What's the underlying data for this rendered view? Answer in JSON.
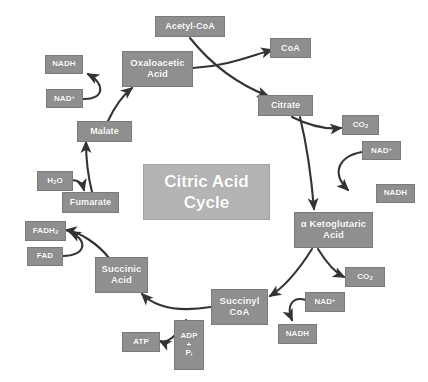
{
  "diagram": {
    "title": "Citric Acid\nCycle",
    "background_color": "#ffffff",
    "node_color": "#8f8f8f",
    "center_color": "#b4b4b4",
    "text_color": "#ffffff",
    "arrow_color": "#333333"
  },
  "nodes": [
    {
      "id": "acetyl-coa",
      "label": "Acetyl-CoA",
      "x": 155,
      "y": 16,
      "w": 70,
      "h": 21,
      "size": "n-mid"
    },
    {
      "id": "coa",
      "label": "CoA",
      "x": 270,
      "y": 38,
      "w": 41,
      "h": 20,
      "size": "n-mid"
    },
    {
      "id": "oxaloacetic",
      "label": "Oxaloacetic\nAcid",
      "x": 122,
      "y": 51,
      "w": 71,
      "h": 36,
      "size": "n-big"
    },
    {
      "id": "nadh-malate",
      "label": "NADH",
      "x": 45,
      "y": 55,
      "w": 38,
      "h": 19,
      "size": "n-small"
    },
    {
      "id": "nad-malate",
      "label": "NAD+",
      "x": 46,
      "y": 89,
      "w": 37,
      "h": 19,
      "size": "n-small"
    },
    {
      "id": "citrate",
      "label": "Citrate",
      "x": 258,
      "y": 95,
      "w": 55,
      "h": 21,
      "size": "n-mid"
    },
    {
      "id": "co2-isocitrate",
      "label": "CO2",
      "x": 342,
      "y": 115,
      "w": 37,
      "h": 20,
      "size": "n-small"
    },
    {
      "id": "malate",
      "label": "Malate",
      "x": 77,
      "y": 121,
      "w": 55,
      "h": 21,
      "size": "n-mid"
    },
    {
      "id": "nad-ketoglut",
      "label": "NAD+",
      "x": 362,
      "y": 141,
      "w": 39,
      "h": 19,
      "size": "n-small"
    },
    {
      "id": "h2o",
      "label": "H2O",
      "x": 37,
      "y": 171,
      "w": 36,
      "h": 20,
      "size": "n-small"
    },
    {
      "id": "nadh-ketoglut",
      "label": "NADH",
      "x": 376,
      "y": 184,
      "w": 39,
      "h": 19,
      "size": "n-small"
    },
    {
      "id": "fumarate",
      "label": "Fumarate",
      "x": 62,
      "y": 192,
      "w": 57,
      "h": 21,
      "size": "n-mid"
    },
    {
      "id": "alpha-ketoglut",
      "label": "α Ketoglutaric\nAcid",
      "x": 294,
      "y": 212,
      "w": 79,
      "h": 36,
      "size": "n-big"
    },
    {
      "id": "fadh2",
      "label": "FADH2",
      "x": 25,
      "y": 221,
      "w": 41,
      "h": 20,
      "size": "n-small"
    },
    {
      "id": "fad",
      "label": "FAD",
      "x": 27,
      "y": 247,
      "w": 36,
      "h": 19,
      "size": "n-small"
    },
    {
      "id": "succinic-acid",
      "label": "Succinic\nAcid",
      "x": 95,
      "y": 257,
      "w": 53,
      "h": 36,
      "size": "n-big"
    },
    {
      "id": "co2-succinyl",
      "label": "CO2",
      "x": 345,
      "y": 267,
      "w": 40,
      "h": 20,
      "size": "n-small"
    },
    {
      "id": "succinyl-coa",
      "label": "Succinyl\nCoA",
      "x": 211,
      "y": 289,
      "w": 57,
      "h": 36,
      "size": "n-big"
    },
    {
      "id": "nad-succinyl",
      "label": "NAD+",
      "x": 305,
      "y": 292,
      "w": 40,
      "h": 20,
      "size": "n-small"
    },
    {
      "id": "adp-pi",
      "label": "ADP\n+\nPi",
      "x": 174,
      "y": 320,
      "w": 30,
      "h": 50,
      "size": "n-small"
    },
    {
      "id": "nadh-succinyl",
      "label": "NADH",
      "x": 278,
      "y": 324,
      "w": 39,
      "h": 20,
      "size": "n-small"
    },
    {
      "id": "atp",
      "label": "ATP",
      "x": 122,
      "y": 332,
      "w": 38,
      "h": 20,
      "size": "n-small"
    }
  ],
  "arrows": [
    {
      "id": "acetyl-to-citrate",
      "path": "M 190 38 C 206 58, 232 82, 268 96"
    },
    {
      "id": "oxaloacetic-to-coa",
      "path": "M 193 68 C 228 66, 250 56, 272 50"
    },
    {
      "id": "citrate-to-co2",
      "path": "M 292 117 C 306 124, 322 130, 341 128"
    },
    {
      "id": "citrate-to-ketoglut",
      "path": "M 300 117 C 308 150, 312 185, 314 209"
    },
    {
      "id": "nad-to-nadh-right",
      "path": "M 362 152 C 340 156, 330 172, 348 190"
    },
    {
      "id": "ketoglut-to-co2",
      "path": "M 318 249 C 326 262, 334 272, 344 277"
    },
    {
      "id": "ketoglut-to-succinyl",
      "path": "M 312 249 C 300 268, 286 286, 270 296"
    },
    {
      "id": "nad-to-nadh-bottom",
      "path": "M 306 300 C 292 296, 286 306, 292 320"
    },
    {
      "id": "succinyl-to-succinic",
      "path": "M 211 307 C 180 312, 156 308, 142 294"
    },
    {
      "id": "adp-to-atp",
      "path": "M 186 320 C 178 336, 166 344, 160 341"
    },
    {
      "id": "succinic-to-fadh2",
      "path": "M 109 258 C 98 244, 80 232, 66 230"
    },
    {
      "id": "fad-to-fadh2",
      "path": "M 63 256 C 84 256, 90 242, 70 232"
    },
    {
      "id": "fumarate-to-malate",
      "path": "M 92 192 C 88 176, 86 158, 86 142"
    },
    {
      "id": "h2o-to-fumarate",
      "path": "M 70 180 C 78 180, 82 182, 84 190"
    },
    {
      "id": "malate-to-oxaloacetic",
      "path": "M 108 121 C 114 108, 122 96, 132 88"
    },
    {
      "id": "nad-to-nadh-left",
      "path": "M 83 99 C 104 100, 106 84, 88 74"
    }
  ]
}
